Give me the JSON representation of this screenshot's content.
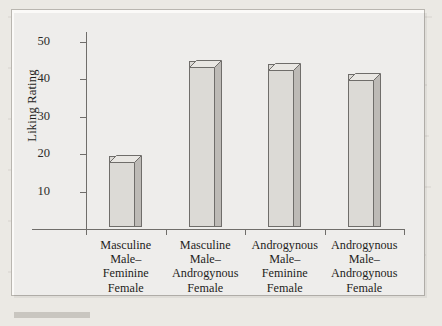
{
  "figure": {
    "background_color": "#fbfaf8",
    "page_color": "#ebe9e4",
    "axis_color": "#6f6d6a",
    "bar_face_color": "#dcdad6",
    "bar_side_color": "#bdbab6",
    "bar_top_color": "#e9e7e3"
  },
  "chart_data": {
    "type": "bar",
    "title": "",
    "xlabel": "",
    "ylabel": "Liking Rating",
    "ylim": [
      0,
      50
    ],
    "yticks": [
      10,
      20,
      30,
      40,
      50
    ],
    "ytick_labels": [
      "10",
      "20",
      "30",
      "40",
      "50"
    ],
    "grid": false,
    "legend": null,
    "categories": [
      "Masculine Male–Feminine Female",
      "Masculine Male–Androgynous Female",
      "Androgynous Male–Feminine Female",
      "Androgynous Male–Androgynous Female"
    ],
    "category_lines": [
      [
        "Masculine",
        "Male–",
        "Feminine",
        "Female"
      ],
      [
        "Masculine",
        "Male–",
        "Androgynous",
        "Female"
      ],
      [
        "Androgynous",
        "Male–",
        "Feminine",
        "Female"
      ],
      [
        "Androgynous",
        "Male–",
        "Androgynous",
        "Female"
      ]
    ],
    "values": [
      19,
      44.5,
      43.5,
      41
    ],
    "series": [
      {
        "name": "Liking Rating",
        "values": [
          19,
          44.5,
          43.5,
          41
        ]
      }
    ]
  }
}
